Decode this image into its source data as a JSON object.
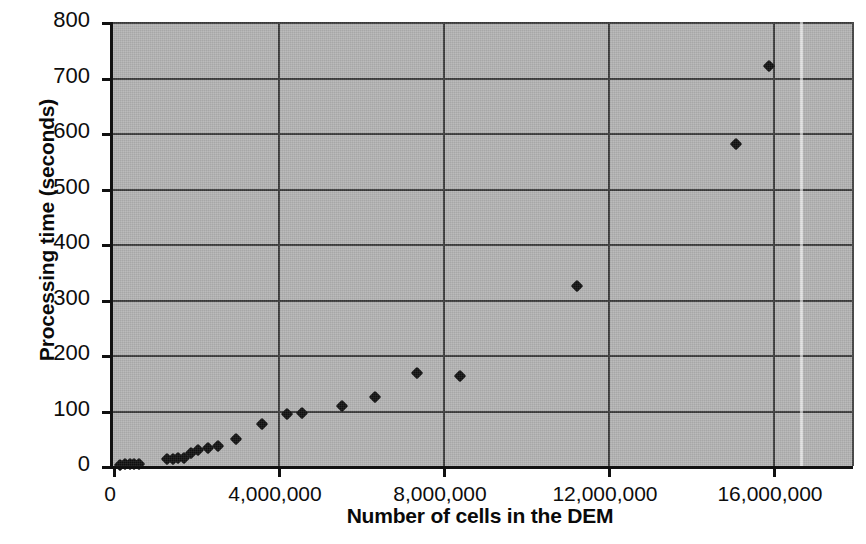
{
  "chart_data": {
    "type": "scatter",
    "title": "",
    "xlabel": "Number of cells in the DEM",
    "ylabel": "Processing time (seconds)",
    "xlim": [
      0,
      17939000
    ],
    "ylim": [
      0,
      800
    ],
    "grid": true,
    "legend": "none",
    "marker": "diamond",
    "marker_color": "#111111",
    "plot_background": "#b3b3b3",
    "xticks": [
      0,
      4000000,
      8000000,
      12000000,
      16000000
    ],
    "xtick_labels": [
      "0",
      "4,000,000",
      "8,000,000",
      "12,000,000",
      "16,000,000"
    ],
    "yticks": [
      0,
      100,
      200,
      300,
      400,
      500,
      600,
      700,
      800
    ],
    "ytick_labels": [
      "0",
      "100",
      "200",
      "300",
      "400",
      "500",
      "600",
      "700",
      "800"
    ],
    "points": [
      {
        "x": 170000,
        "y": 2
      },
      {
        "x": 290000,
        "y": 3
      },
      {
        "x": 400000,
        "y": 3
      },
      {
        "x": 510000,
        "y": 4
      },
      {
        "x": 620000,
        "y": 4
      },
      {
        "x": 1310000,
        "y": 12
      },
      {
        "x": 1450000,
        "y": 13
      },
      {
        "x": 1580000,
        "y": 14
      },
      {
        "x": 1720000,
        "y": 15
      },
      {
        "x": 1900000,
        "y": 24
      },
      {
        "x": 2070000,
        "y": 28
      },
      {
        "x": 2310000,
        "y": 32
      },
      {
        "x": 2550000,
        "y": 36
      },
      {
        "x": 2980000,
        "y": 48
      },
      {
        "x": 3610000,
        "y": 75
      },
      {
        "x": 4220000,
        "y": 94
      },
      {
        "x": 4580000,
        "y": 96
      },
      {
        "x": 5540000,
        "y": 108
      },
      {
        "x": 6350000,
        "y": 125
      },
      {
        "x": 7370000,
        "y": 168
      },
      {
        "x": 8410000,
        "y": 163
      },
      {
        "x": 11250000,
        "y": 325
      },
      {
        "x": 15100000,
        "y": 580
      },
      {
        "x": 15900000,
        "y": 720
      }
    ]
  }
}
